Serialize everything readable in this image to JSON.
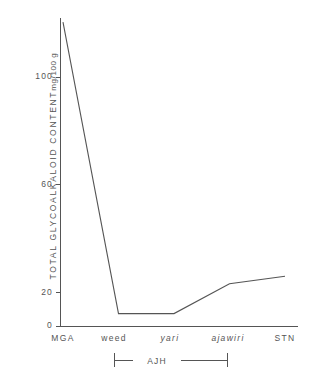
{
  "chart_data": {
    "type": "line",
    "title": "",
    "xlabel": "",
    "ylabel": "TOTAL GLYCOALKALOID CONTENT",
    "yunit": "mg/100 g",
    "categories": [
      "MGA",
      "weed",
      "yari",
      "ajawiri",
      "STN"
    ],
    "categories_italic": [
      false,
      false,
      true,
      true,
      false
    ],
    "values": [
      122,
      5,
      5,
      17,
      20
    ],
    "series": [
      {
        "name": "total glycoalkaloid content",
        "values": [
          122,
          5,
          5,
          17,
          20
        ]
      }
    ],
    "yticks": [
      0,
      20,
      60,
      100
    ],
    "ytick_labels": [
      "0",
      "20",
      "60",
      "100"
    ],
    "ylim": [
      0,
      130
    ],
    "grid": false,
    "legend": false,
    "annotations": [
      {
        "name": "ajh-bracket",
        "label": "AJH",
        "spans": [
          "weed",
          "ajawiri"
        ]
      }
    ],
    "line_color": "#555555",
    "axis_color": "#555555"
  }
}
